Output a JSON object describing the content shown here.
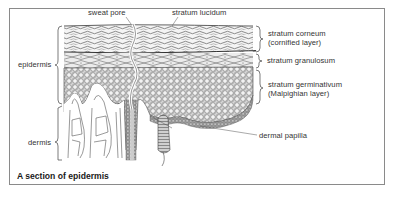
{
  "figure": {
    "caption": "A section of epidermis",
    "labels": {
      "sweat_pore": "sweat pore",
      "stratum_lucidum": "stratum lucidum",
      "stratum_corneum_line1": "stratum corneum",
      "stratum_corneum_line2": "(cornified layer)",
      "stratum_granulosum": "stratum granulosum",
      "stratum_germinativum_line1": "stratum germinativum",
      "stratum_germinativum_line2": "(Malpighian layer)",
      "dermal_papilla": "dermal papilla",
      "epidermis": "epidermis",
      "dermis": "dermis"
    },
    "colors": {
      "frame": "#8a8a8a",
      "ink": "#333333",
      "shade": "#9a9a9a"
    }
  }
}
